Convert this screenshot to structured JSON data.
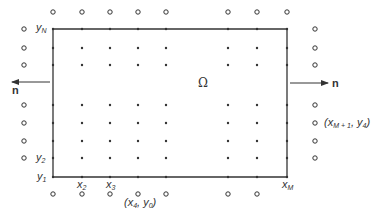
{
  "diagram": {
    "domain_symbol": "Ω",
    "normal_label": "n",
    "labels": {
      "yN": {
        "base": "y",
        "sub": "N"
      },
      "y2": {
        "base": "y",
        "sub": "2"
      },
      "y1": {
        "base": "y",
        "sub": "1"
      },
      "x2": {
        "base": "x",
        "sub": "2"
      },
      "x3": {
        "base": "x",
        "sub": "3"
      },
      "xM": {
        "base": "x",
        "sub": "M"
      },
      "ghost_bottom": {
        "text": "(x4, y0)",
        "x_sub": "4",
        "y_sub": "0"
      },
      "ghost_right": {
        "text": "(xM+1, y4)",
        "x_sub": "M + 1",
        "y_sub": "4"
      }
    },
    "grid": {
      "columns_x": [
        53,
        82,
        110,
        138,
        166,
        228,
        257,
        287
      ],
      "rows_y": [
        29,
        48,
        65,
        105,
        123,
        141,
        158,
        177
      ],
      "boundary": {
        "left": 53,
        "right": 287,
        "top": 29,
        "bottom": 177
      },
      "ghost_left_x": 24,
      "ghost_right_x": 315,
      "ghost_top_y": 12,
      "ghost_bottom_y": 194
    },
    "colors": {
      "ink": "#333333",
      "background": "#ffffff"
    }
  }
}
